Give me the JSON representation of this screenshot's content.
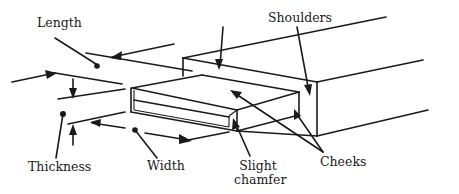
{
  "diagram": {
    "labels": {
      "length": "Length",
      "shoulders": "Shoulders",
      "thickness": "Thickness",
      "width": "Width",
      "slight_chamfer_line1": "Slight",
      "slight_chamfer_line2": "chamfer",
      "cheeks": "Cheeks"
    },
    "parts": [
      {
        "id": "length",
        "label": "Length",
        "indicates": "distance the tenon projects from the shoulders"
      },
      {
        "id": "shoulders",
        "label": "Shoulders",
        "indicates": "stepped faces where the tenon meets the rail"
      },
      {
        "id": "thickness",
        "label": "Thickness",
        "indicates": "tenon dimension between the cheeks"
      },
      {
        "id": "width",
        "label": "Width",
        "indicates": "tenon dimension across its face"
      },
      {
        "id": "slight_chamfer",
        "label": "Slight chamfer",
        "indicates": "bevelled end edges of the tenon"
      },
      {
        "id": "cheeks",
        "label": "Cheeks",
        "indicates": "broad flat faces of the tenon"
      }
    ],
    "colors": {
      "ink": "#1a1a1a",
      "background": "#ffffff"
    }
  }
}
